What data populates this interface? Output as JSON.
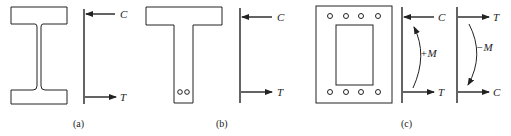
{
  "figure": {
    "panels": [
      {
        "id": "a",
        "caption": "(a)",
        "section": "I-beam",
        "top_force": "C",
        "bottom_force": "T"
      },
      {
        "id": "b",
        "caption": "(b)",
        "section": "T-beam with two bottom bars",
        "top_force": "C",
        "bottom_force": "T"
      },
      {
        "id": "c",
        "caption": "(c)",
        "section": "Hollow box with top and bottom bars",
        "diagrams": [
          {
            "moment_label": "+M",
            "top_force": "C",
            "bottom_force": "T"
          },
          {
            "moment_label": "−M",
            "top_force": "T",
            "bottom_force": "C"
          }
        ]
      }
    ]
  }
}
